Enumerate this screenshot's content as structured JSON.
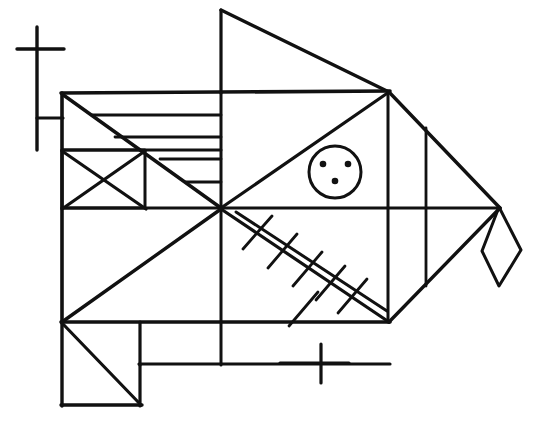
{
  "artwork": {
    "title": "Hand-drawn geometric fish",
    "subject": "fish",
    "style": "black ink line drawing on white paper",
    "background_color": "#ffffff",
    "ink_color": "#111111",
    "canvas": {
      "width": 538,
      "height": 425
    }
  },
  "stroke_widths": {
    "outline": 3.6,
    "interior": 3.0,
    "thin": 2.6,
    "hair": 2.2
  },
  "parts": {
    "mast": {
      "name": "mast-cross",
      "vertical": {
        "x": 37,
        "y1": 27,
        "y2": 150
      },
      "crossbar": {
        "y": 49,
        "x1": 17,
        "x2": 64
      },
      "stub": {
        "y": 118,
        "x1": 37,
        "x2": 63
      }
    },
    "dorsal_fin": {
      "name": "dorsal-triangle",
      "points": "221,10 221,95 388,92"
    },
    "body_outline": {
      "name": "body-outline",
      "points": "62,93 388,92 500,208 388,322 62,322"
    },
    "head_stripes": {
      "name": "horizontal-stripe-rows",
      "count": 5,
      "rows": [
        {
          "y": 92,
          "x1": 62,
          "x2": 388
        },
        {
          "y": 114,
          "x1": 84,
          "x2": 221
        },
        {
          "y": 136,
          "x1": 106,
          "x2": 221
        },
        {
          "y": 150,
          "x1": 62,
          "x2": 221
        },
        {
          "y": 158,
          "x1": 150,
          "x2": 221
        },
        {
          "y": 181,
          "x1": 173,
          "x2": 221
        }
      ]
    },
    "head_diagonal": {
      "name": "head-diagonal",
      "from": [
        62,
        93
      ],
      "to": [
        221,
        208
      ]
    },
    "x_box": {
      "name": "x-crossed-box",
      "rect": {
        "x": 62,
        "y": 150,
        "w": 83,
        "h": 58
      },
      "diagonals": [
        {
          "from": [
            62,
            150
          ],
          "to": [
            145,
            208
          ]
        },
        {
          "from": [
            145,
            150
          ],
          "to": [
            62,
            208
          ]
        }
      ]
    },
    "center_cross": {
      "name": "center-axis-lines",
      "horizontal": {
        "y": 208,
        "x1": 62,
        "x2": 500
      },
      "vertical": {
        "x": 221,
        "y1": 92,
        "y2": 365
      }
    },
    "eye": {
      "name": "eye-circle",
      "center": [
        335,
        172
      ],
      "radius": 26,
      "dots": [
        {
          "cx": 323,
          "cy": 164,
          "r": 3.2
        },
        {
          "cx": 348,
          "cy": 164,
          "r": 3.2
        },
        {
          "cx": 335,
          "cy": 180,
          "r": 3.2
        }
      ]
    },
    "gill_diagonals": {
      "name": "gill-diagonals",
      "upper": {
        "from": [
          221,
          208
        ],
        "to": [
          388,
          92
        ]
      },
      "lower": {
        "from": [
          221,
          208
        ],
        "to": [
          388,
          322
        ]
      }
    },
    "rear_verticals": {
      "name": "tail-section-verticals",
      "lines": [
        {
          "x": 388,
          "y1": 92,
          "y2": 322
        },
        {
          "x": 425,
          "y1": 128,
          "y2": 285
        }
      ]
    },
    "tail_triangles": {
      "name": "tail-triangle",
      "upper": {
        "from": [
          388,
          92
        ],
        "to": [
          500,
          208
        ]
      },
      "lower": {
        "from": [
          500,
          208
        ],
        "to": [
          388,
          322
        ]
      }
    },
    "kite": {
      "name": "tail-kite-diamond",
      "points": "499,207 521,250 499,286 482,251"
    },
    "bone_fin": {
      "name": "herringbone-fin",
      "spine": {
        "from": [
          236,
          212
        ],
        "to": [
          386,
          311
        ]
      },
      "tick_count": 6,
      "tick_length": 40
    },
    "belly_lines": {
      "name": "belly-lines",
      "lines": [
        {
          "from": [
            62,
            322
          ],
          "to": [
            221,
            208
          ]
        },
        {
          "from": [
            62,
            208
          ],
          "to": [
            145,
            150
          ]
        }
      ]
    },
    "foot_box": {
      "name": "foot-box",
      "rect": {
        "x": 62,
        "y": 322,
        "w": 78,
        "h": 83
      },
      "diagonal": {
        "from": [
          62,
          322
        ],
        "to": [
          140,
          405
        ]
      }
    },
    "lower_bar": {
      "name": "lower-horizontal-bar",
      "y": 364,
      "x1": 140,
      "x2": 389
    },
    "bottom_cross": {
      "name": "bottom-cross-mark",
      "vertical": {
        "x": 321,
        "y1": 344,
        "y2": 382
      },
      "horizontal": {
        "y": 363,
        "x1": 270,
        "x2": 349
      }
    }
  },
  "labels": {
    "none": ""
  }
}
